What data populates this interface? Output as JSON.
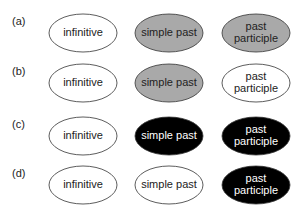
{
  "colors": {
    "white": "#ffffff",
    "gray": "#a9a9a9",
    "black": "#000000",
    "stroke": "#333333"
  },
  "rows": [
    {
      "label": "(a)",
      "cells": [
        {
          "text": [
            "infinitive"
          ],
          "fill": "white"
        },
        {
          "text": [
            "simple past"
          ],
          "fill": "gray"
        },
        {
          "text": [
            "past",
            "participle"
          ],
          "fill": "gray"
        }
      ]
    },
    {
      "label": "(b)",
      "cells": [
        {
          "text": [
            "infinitive"
          ],
          "fill": "white"
        },
        {
          "text": [
            "simple past"
          ],
          "fill": "gray"
        },
        {
          "text": [
            "past",
            "participle"
          ],
          "fill": "white"
        }
      ]
    },
    {
      "label": "(c)",
      "cells": [
        {
          "text": [
            "infinitive"
          ],
          "fill": "white"
        },
        {
          "text": [
            "simple past"
          ],
          "fill": "black"
        },
        {
          "text": [
            "past",
            "participle"
          ],
          "fill": "black"
        }
      ]
    },
    {
      "label": "(d)",
      "cells": [
        {
          "text": [
            "infinitive"
          ],
          "fill": "white"
        },
        {
          "text": [
            "simple past"
          ],
          "fill": "white"
        },
        {
          "text": [
            "past",
            "participle"
          ],
          "fill": "black"
        }
      ]
    }
  ]
}
